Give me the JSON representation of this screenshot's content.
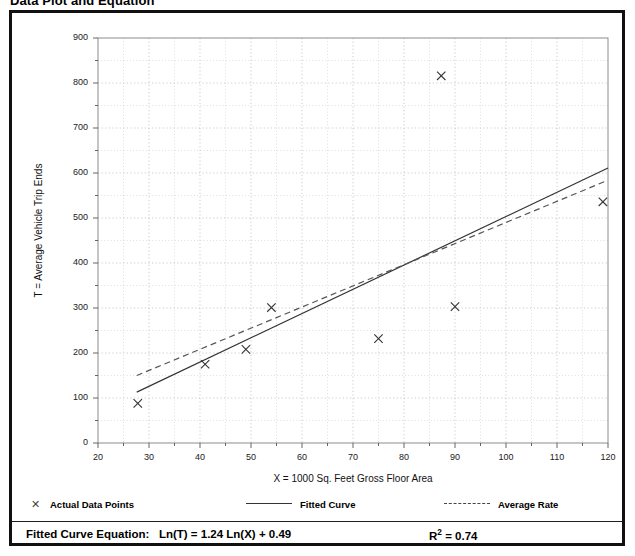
{
  "title": "Data Plot and Equation",
  "legend": {
    "items": [
      {
        "label": "Actual Data Points",
        "marker": "x-marker-icon",
        "style": "marker"
      },
      {
        "label": "Fitted Curve",
        "marker": "solid-line-icon",
        "style": "solid"
      },
      {
        "label": "Average Rate",
        "marker": "dashed-line-icon",
        "style": "dashed"
      }
    ]
  },
  "equation": {
    "prefix": "Fitted Curve Equation:",
    "formula": "Ln(T) = 1.24 Ln(X) + 0.49",
    "r_squared_label": "R",
    "r_squared_exp": "2",
    "r_squared_value": "= 0.74"
  },
  "chart_data": {
    "type": "scatter",
    "title": "Data Plot and Equation",
    "xlabel": "X = 1000 Sq. Feet Gross Floor Area",
    "ylabel": "T = Average Vehicle Trip Ends",
    "xlim": [
      20,
      120
    ],
    "ylim": [
      0,
      900
    ],
    "xticks": [
      20,
      30,
      40,
      50,
      60,
      70,
      80,
      90,
      100,
      110,
      120
    ],
    "yticks": [
      0,
      100,
      200,
      300,
      400,
      500,
      600,
      700,
      800,
      900
    ],
    "x_minor_step": 5,
    "y_minor_step": 50,
    "grid": true,
    "grid_style": "dotted",
    "legend_position": "below-plot",
    "series": [
      {
        "name": "Actual Data Points",
        "type": "scatter",
        "marker": "x",
        "color": "#333333",
        "points": [
          {
            "x": 27.8,
            "y": 88
          },
          {
            "x": 41.0,
            "y": 175
          },
          {
            "x": 49.0,
            "y": 208
          },
          {
            "x": 54.0,
            "y": 301
          },
          {
            "x": 75.0,
            "y": 232
          },
          {
            "x": 87.3,
            "y": 816
          },
          {
            "x": 90.0,
            "y": 303
          },
          {
            "x": 119.0,
            "y": 536
          }
        ]
      },
      {
        "name": "Fitted Curve",
        "type": "line",
        "style": "solid",
        "color": "#333333",
        "equation": "Ln(T) = 1.24 Ln(X) + 0.49",
        "r_squared": 0.74,
        "endpoints": [
          {
            "x": 27.6,
            "y": 113
          },
          {
            "x": 120.0,
            "y": 611
          }
        ]
      },
      {
        "name": "Average Rate",
        "type": "line",
        "style": "dashed",
        "color": "#555555",
        "endpoints": [
          {
            "x": 27.6,
            "y": 150
          },
          {
            "x": 120.0,
            "y": 584
          }
        ]
      }
    ]
  }
}
